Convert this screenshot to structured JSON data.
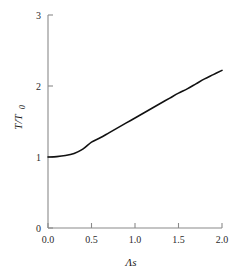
{
  "chart_data": {
    "type": "line",
    "title": "",
    "subtitle": "",
    "xlabel": "Λs",
    "ylabel": "T/T",
    "ylabel_sub": "0",
    "xlim": [
      0.0,
      2.0
    ],
    "ylim": [
      0.0,
      3.0
    ],
    "grid": false,
    "legend": null,
    "xticks": [
      0.0,
      0.5,
      1.0,
      1.5,
      2.0
    ],
    "xticklabels": [
      "0.0",
      "0.5",
      "1.0",
      "1.5",
      "2.0"
    ],
    "yticks": [
      0,
      1,
      2,
      3
    ],
    "yticklabels": [
      "0",
      "1",
      "2",
      "3"
    ],
    "series": [
      {
        "name": "T/T0",
        "color": "#111111",
        "x": [
          0.0,
          0.1,
          0.2,
          0.3,
          0.4,
          0.5,
          0.6,
          0.7,
          0.8,
          0.9,
          1.0,
          1.1,
          1.2,
          1.3,
          1.4,
          1.5,
          1.6,
          1.7,
          1.8,
          1.9,
          2.0
        ],
        "y": [
          1.0,
          1.005,
          1.02,
          1.05,
          1.11,
          1.21,
          1.27,
          1.34,
          1.41,
          1.48,
          1.55,
          1.62,
          1.69,
          1.76,
          1.83,
          1.9,
          1.96,
          2.03,
          2.1,
          2.16,
          2.22
        ]
      }
    ]
  },
  "axes": {
    "x_tick_0": "0.0",
    "x_tick_1": "0.5",
    "x_tick_2": "1.0",
    "x_tick_3": "1.5",
    "x_tick_4": "2.0",
    "y_tick_0": "0",
    "y_tick_1": "1",
    "y_tick_2": "2",
    "y_tick_3": "3",
    "x_title": "Λs",
    "y_title_main": "T/T",
    "y_title_sub": "0"
  },
  "colors": {
    "curve": "#111111",
    "axis": "#8a8a8a",
    "text": "#1a1a1a",
    "background": "#ffffff"
  }
}
